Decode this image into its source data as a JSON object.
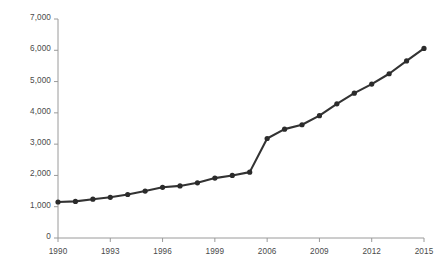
{
  "chart_data": {
    "type": "line",
    "title": "",
    "subtitle": "",
    "xlabel": "",
    "ylabel": "",
    "xlim": [
      1990,
      2015
    ],
    "ylim": [
      0,
      7000
    ],
    "grid": false,
    "legend": false,
    "legend_position": "none",
    "line_color": "#333333",
    "marker": "circle",
    "marker_color": "#2b2b2b",
    "axis_color": "#9a9a9a",
    "x_tick_labels": [
      "1990",
      "1993",
      "1996",
      "1999",
      "2006",
      "2009",
      "2012",
      "2015"
    ],
    "y_tick_labels": [
      "0",
      "1,000",
      "2,000",
      "3,000",
      "4,000",
      "5,000",
      "6,000",
      "7,000"
    ],
    "y_tick_values": [
      0,
      1000,
      2000,
      3000,
      4000,
      5000,
      6000,
      7000
    ],
    "note": "x axis label sequence jumps from 1999 to 2006 across one tick interval",
    "x": [
      1990,
      1991,
      1992,
      1993,
      1994,
      1995,
      1996,
      1997,
      1998,
      1999,
      2000,
      2005,
      2006,
      2007,
      2008,
      2009,
      2010,
      2011,
      2012,
      2013,
      2014,
      2015
    ],
    "categories": [
      "1990",
      "1991",
      "1992",
      "1993",
      "1994",
      "1995",
      "1996",
      "1997",
      "1998",
      "1999",
      "2000",
      "2005",
      "2006",
      "2007",
      "2008",
      "2009",
      "2010",
      "2011",
      "2012",
      "2013",
      "2014",
      "2015"
    ],
    "values": [
      1150,
      1170,
      1240,
      1300,
      1390,
      1500,
      1620,
      1665,
      1765,
      1915,
      2000,
      2105,
      3180,
      3480,
      3620,
      3910,
      4290,
      4630,
      4920,
      5250,
      5660,
      6060
    ],
    "series": [
      {
        "name": "series-1",
        "values": [
          1150,
          1170,
          1240,
          1300,
          1390,
          1500,
          1620,
          1665,
          1765,
          1915,
          2000,
          2105,
          3180,
          3480,
          3620,
          3910,
          4290,
          4630,
          4920,
          5250,
          5660,
          6060
        ]
      }
    ]
  }
}
